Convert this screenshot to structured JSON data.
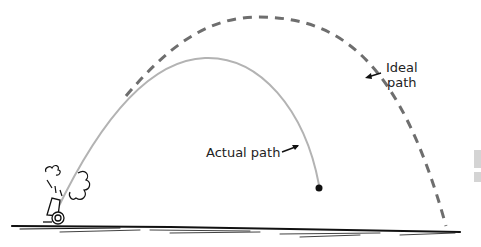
{
  "figure": {
    "labels": {
      "actual_path": "Actual path",
      "ideal_path_line1": "Ideal",
      "ideal_path_line2": "path"
    },
    "elements": {
      "cannon": "cannon-icon",
      "smoke": "smoke-puff",
      "projectile": "cannonball",
      "ground": "ground-line"
    },
    "colors": {
      "actual_path": "#b3b3b3",
      "ideal_path": "#6e6e6e",
      "ink": "#111111"
    }
  }
}
